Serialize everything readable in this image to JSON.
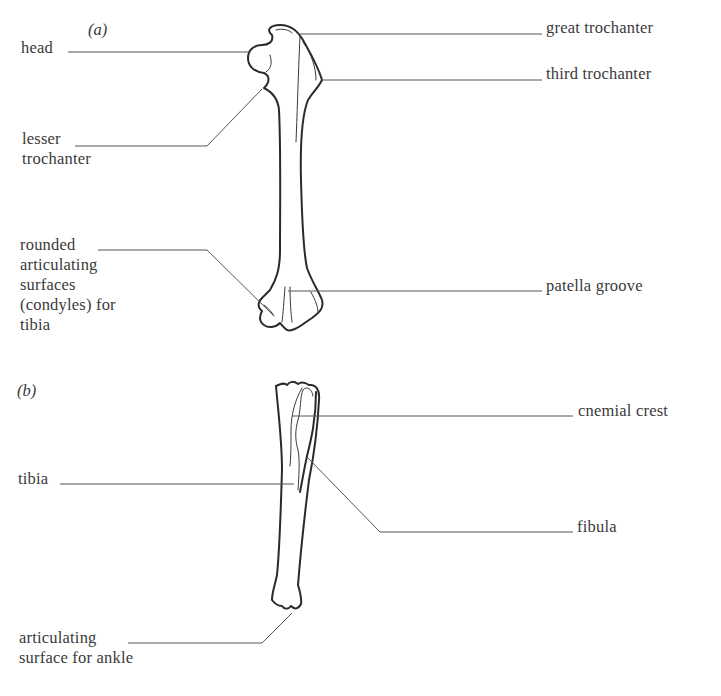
{
  "figure": {
    "panels": [
      {
        "tag": "(a)",
        "bone": "femur",
        "labels": {
          "head": "head",
          "lesser_trochanter": "lesser\ntrochanter",
          "rounded_surfaces": "rounded\narticulating\nsurfaces\n(condyles) for\ntibia",
          "great_trochanter": "great trochanter",
          "third_trochanter": "third trochanter",
          "patella_groove": "patella groove"
        }
      },
      {
        "tag": "(b)",
        "bone": "tibia-fibula",
        "labels": {
          "tibia": "tibia",
          "ankle_surface": "articulating\nsurface for ankle",
          "cnemial_crest": "cnemial crest",
          "fibula": "fibula"
        }
      }
    ]
  },
  "colors": {
    "background": "#ffffff",
    "text": "#3a3a3a",
    "outline": "#2a2a2a",
    "leader": "#555555"
  }
}
